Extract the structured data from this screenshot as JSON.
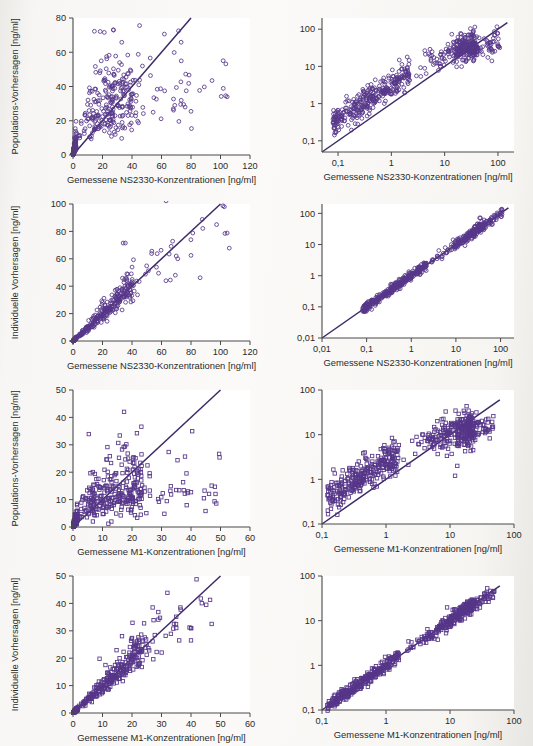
{
  "figure": {
    "background_color": "#f8f7f5",
    "marker_color": "#563689",
    "line_color": "#3c2a66",
    "axis_color": "#4a4a4a",
    "panel_count": 8,
    "columns": 2,
    "rows": 4,
    "left_column_scale": "linear",
    "right_column_scale": "log-log"
  },
  "labels": {
    "y_population": "Populations-Vorhersagen [ng/ml]",
    "y_individual": "Individuelle Vorhersagen [ng/ml]",
    "x_ns2330": "Gemessene NS2330-Konzentrationen [ng/ml]",
    "x_m1": "Gemessene M1-Konzentrationen [ng/ml]"
  },
  "chart_data": [
    {
      "id": "panel-1",
      "type": "scatter",
      "title": "",
      "xlabel": "Gemessene NS2330-Konzentrationen [ng/ml]",
      "ylabel": "Populations-Vorhersagen [ng/ml]",
      "xscale": "linear",
      "yscale": "linear",
      "xlim": [
        0,
        120
      ],
      "ylim": [
        0,
        80
      ],
      "xticks": [
        0,
        20,
        40,
        60,
        80,
        100,
        120
      ],
      "xticklabels": [
        "0",
        "20",
        "40",
        "60",
        "80",
        "100",
        "120"
      ],
      "yticks": [
        0,
        20,
        40,
        60,
        80
      ],
      "yticklabels": [
        "0",
        "20",
        "40",
        "60",
        "80"
      ],
      "marker": "circle",
      "grid": false,
      "legend": false,
      "annotations": [
        "identity line y = x from (0,0) to (80,80)"
      ],
      "reference_line": {
        "type": "identity",
        "x": [
          0,
          80
        ],
        "y": [
          0,
          80
        ]
      },
      "n_points": 620,
      "point_cloud_note": "Dense cloud 0-50 ng/ml measured, predictions plateau near 20-35; outliers near x=100-105, y=34"
    },
    {
      "id": "panel-2",
      "type": "scatter",
      "xlabel": "Gemessene NS2330-Konzentrationen [ng/ml]",
      "ylabel": "Populations-Vorhersagen [ng/ml]",
      "xscale": "log",
      "yscale": "log",
      "xlim": [
        0.05,
        200
      ],
      "ylim": [
        0.05,
        200
      ],
      "xticks": [
        0.1,
        1,
        10,
        100
      ],
      "xticklabels": [
        "0,1",
        "1",
        "10",
        "100"
      ],
      "yticks": [
        0.1,
        1,
        10,
        100
      ],
      "yticklabels": [
        "0,1",
        "1",
        "10",
        "100"
      ],
      "marker": "circle",
      "grid": false,
      "legend": false,
      "reference_line": {
        "type": "identity",
        "x": [
          0.05,
          150
        ],
        "y": [
          0.05,
          150
        ]
      },
      "n_points": 620
    },
    {
      "id": "panel-3",
      "type": "scatter",
      "xlabel": "Gemessene NS2330-Konzentrationen [ng/ml]",
      "ylabel": "Individuelle Vorhersagen [ng/ml]",
      "xscale": "linear",
      "yscale": "linear",
      "xlim": [
        0,
        120
      ],
      "ylim": [
        0,
        100
      ],
      "xticks": [
        0,
        20,
        40,
        60,
        80,
        100,
        120
      ],
      "xticklabels": [
        "0",
        "20",
        "40",
        "60",
        "80",
        "100",
        "120"
      ],
      "yticks": [
        0,
        20,
        40,
        60,
        80,
        100
      ],
      "yticklabels": [
        "0",
        "20",
        "40",
        "60",
        "80",
        "100"
      ],
      "marker": "circle",
      "grid": false,
      "legend": false,
      "reference_line": {
        "type": "identity",
        "x": [
          0,
          100
        ],
        "y": [
          0,
          100
        ]
      },
      "n_points": 620
    },
    {
      "id": "panel-4",
      "type": "scatter",
      "xlabel": "Gemessene NS2330-Konzentrationen [ng/ml]",
      "ylabel": "Individuelle Vorhersagen [ng/ml]",
      "xscale": "log",
      "yscale": "log",
      "xlim": [
        0.01,
        200
      ],
      "ylim": [
        0.01,
        200
      ],
      "xticks": [
        0.01,
        0.1,
        1,
        10,
        100
      ],
      "xticklabels": [
        "0,01",
        "0,1",
        "1",
        "10",
        "100"
      ],
      "yticks": [
        0.01,
        0.1,
        1,
        10,
        100
      ],
      "yticklabels": [
        "0,01",
        "0,1",
        "1",
        "10",
        "100"
      ],
      "marker": "circle",
      "grid": false,
      "legend": false,
      "reference_line": {
        "type": "identity",
        "x": [
          0.01,
          150
        ],
        "y": [
          0.01,
          150
        ]
      },
      "n_points": 620
    },
    {
      "id": "panel-5",
      "type": "scatter",
      "xlabel": "Gemessene M1-Konzentrationen [ng/ml]",
      "ylabel": "Populations-Vorhersagen [ng/ml]",
      "xscale": "linear",
      "yscale": "linear",
      "xlim": [
        0,
        60
      ],
      "ylim": [
        0,
        50
      ],
      "xticks": [
        0,
        10,
        20,
        30,
        40,
        50,
        60
      ],
      "xticklabels": [
        "0",
        "10",
        "20",
        "30",
        "40",
        "50",
        "60"
      ],
      "yticks": [
        0,
        10,
        20,
        30,
        40,
        50
      ],
      "yticklabels": [
        "0",
        "10",
        "20",
        "30",
        "40",
        "50"
      ],
      "marker": "square",
      "grid": false,
      "legend": false,
      "reference_line": {
        "type": "identity",
        "x": [
          0,
          50
        ],
        "y": [
          0,
          50
        ]
      },
      "n_points": 600
    },
    {
      "id": "panel-6",
      "type": "scatter",
      "xlabel": "Gemessene M1-Konzentrationen [ng/ml]",
      "ylabel": "Populations-Vorhersagen [ng/ml]",
      "xscale": "log",
      "yscale": "log",
      "xlim": [
        0.1,
        100
      ],
      "ylim": [
        0.1,
        100
      ],
      "xticks": [
        0.1,
        1,
        10,
        100
      ],
      "xticklabels": [
        "0,1",
        "1",
        "10",
        "100"
      ],
      "yticks": [
        0.1,
        1,
        10,
        100
      ],
      "yticklabels": [
        "0,1",
        "1",
        "10",
        "100"
      ],
      "marker": "square",
      "grid": false,
      "legend": false,
      "reference_line": {
        "type": "identity",
        "x": [
          0.1,
          60
        ],
        "y": [
          0.1,
          60
        ]
      },
      "n_points": 600
    },
    {
      "id": "panel-7",
      "type": "scatter",
      "xlabel": "Gemessene M1-Konzentrationen [ng/ml]",
      "ylabel": "Individuelle Vorhersagen [ng/ml]",
      "xscale": "linear",
      "yscale": "linear",
      "xlim": [
        0,
        60
      ],
      "ylim": [
        0,
        50
      ],
      "xticks": [
        0,
        10,
        20,
        30,
        40,
        50,
        60
      ],
      "xticklabels": [
        "0",
        "10",
        "20",
        "30",
        "40",
        "50",
        "60"
      ],
      "yticks": [
        0,
        10,
        20,
        30,
        40,
        50
      ],
      "yticklabels": [
        "0",
        "10",
        "20",
        "30",
        "40",
        "50"
      ],
      "marker": "square",
      "grid": false,
      "legend": false,
      "reference_line": {
        "type": "identity",
        "x": [
          0,
          50
        ],
        "y": [
          0,
          50
        ]
      },
      "n_points": 600
    },
    {
      "id": "panel-8",
      "type": "scatter",
      "xlabel": "Gemessene M1-Konzentrationen [ng/ml]",
      "ylabel": "Individuelle Vorhersagen [ng/ml]",
      "xscale": "log",
      "yscale": "log",
      "xlim": [
        0.1,
        100
      ],
      "ylim": [
        0.1,
        100
      ],
      "xticks": [
        0.1,
        1,
        10,
        100
      ],
      "xticklabels": [
        "0,1",
        "1",
        "10",
        "100"
      ],
      "yticks": [
        0.1,
        1,
        10,
        100
      ],
      "yticklabels": [
        "0,1",
        "1",
        "10",
        "100"
      ],
      "marker": "square",
      "grid": false,
      "legend": false,
      "reference_line": {
        "type": "identity",
        "x": [
          0.1,
          60
        ],
        "y": [
          0.1,
          60
        ]
      },
      "n_points": 600
    }
  ]
}
